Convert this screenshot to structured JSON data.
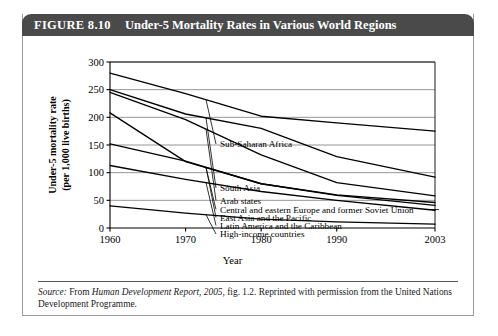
{
  "figure": {
    "number": "FIGURE 8.10",
    "title": "Under-5 Mortality Rates in Various World Regions",
    "source_prefix": "Source:",
    "source_text_a": " From ",
    "source_publication": "Human Development Report, 2005",
    "source_text_b": ", fig. 1.2. Reprinted with permission from the United Nations Development Programme."
  },
  "chart_data": {
    "type": "line",
    "title": "Under-5 Mortality Rates in Various World Regions",
    "xlabel": "Year",
    "ylabel": "Under-5 mortality rate (per 1,000 live births)",
    "ylabel_line1": "Under-5 mortality rate",
    "ylabel_line2": "(per 1,000 live births)",
    "x": [
      1960,
      1970,
      1980,
      1990,
      2003
    ],
    "xlim": [
      1960,
      2003
    ],
    "ylim": [
      0,
      300
    ],
    "xticks": [
      "1960",
      "1970",
      "1980",
      "1990",
      "2003"
    ],
    "yticks": [
      "0",
      "50",
      "100",
      "150",
      "200",
      "250",
      "300"
    ],
    "ytick_values": [
      0,
      50,
      100,
      150,
      200,
      250,
      300
    ],
    "grid": "horizontal",
    "legend_position": "inline-right-labels",
    "series": [
      {
        "name": "Sub-Saharan Africa",
        "values": [
          280,
          243,
          202,
          190,
          175
        ]
      },
      {
        "name": "South Asia",
        "values": [
          250,
          206,
          180,
          129,
          92
        ]
      },
      {
        "name": "Arab states",
        "values": [
          245,
          196,
          132,
          82,
          58
        ]
      },
      {
        "name": "Central and eastern Europe and former Soviet Union",
        "values": [
          208,
          120,
          80,
          60,
          46
        ]
      },
      {
        "name": "East Asia and the Pacific",
        "values": [
          152,
          121,
          80,
          59,
          41
        ]
      },
      {
        "name": "Latin America and the Caribbean",
        "values": [
          113,
          88,
          66,
          50,
          32
        ]
      },
      {
        "name": "High-income countries",
        "values": [
          40,
          27,
          16,
          11,
          7
        ]
      }
    ]
  }
}
